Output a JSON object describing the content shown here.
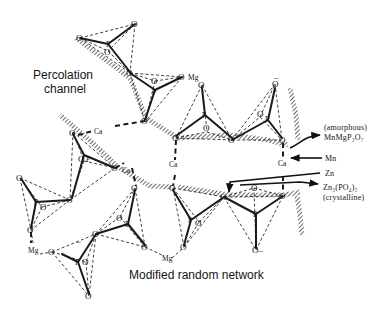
{
  "figure": {
    "labels": {
      "percolation_line1": "Percolation",
      "percolation_line2": "channel",
      "network": "Modified random network"
    },
    "annotations": {
      "amorphous_line1": "(amorphous)",
      "amorphous_formula": "MnMgP₂O₇",
      "mn": "Mn",
      "zn": "Zn",
      "crystalline_formula": "Zn₃(PO₄)₂",
      "crystalline_line2": "(crystalline)"
    },
    "atoms": {
      "oxygen": "O",
      "oxygen_minus": "O–",
      "phosphorus": "P",
      "magnesium": "Mg",
      "calcium": "Ca",
      "charge": "–"
    }
  }
}
